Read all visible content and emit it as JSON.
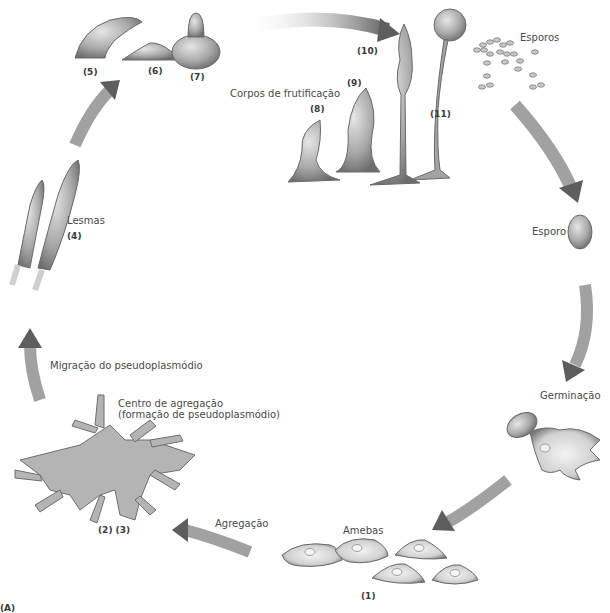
{
  "diagram": {
    "panel_label": "(A)",
    "stages": [
      {
        "id": "amebas",
        "label": "Amebas",
        "number": "(1)"
      },
      {
        "id": "agregacao",
        "label": "Agregação"
      },
      {
        "id": "centro",
        "label_line1": "Centro de agregação",
        "label_line2": "(formação de pseudoplasmódio)",
        "number": "(2) (3)"
      },
      {
        "id": "migracao",
        "label": "Migração do pseudoplasmódio"
      },
      {
        "id": "lesmas",
        "label": "Lesmas",
        "number": "(4)"
      },
      {
        "id": "s5",
        "number": "(5)"
      },
      {
        "id": "s6",
        "number": "(6)"
      },
      {
        "id": "s7",
        "number": "(7)"
      },
      {
        "id": "corpos",
        "label": "Corpos de frutificação"
      },
      {
        "id": "s8",
        "number": "(8)"
      },
      {
        "id": "s9",
        "number": "(9)"
      },
      {
        "id": "s10",
        "number": "(10)"
      },
      {
        "id": "s11",
        "number": "(11)"
      },
      {
        "id": "esporos",
        "label": "Esporos"
      },
      {
        "id": "esporo",
        "label": "Esporo"
      },
      {
        "id": "germinacao",
        "label": "Germinação"
      }
    ],
    "colors": {
      "organism_fill": "#a8a8a8",
      "organism_dark": "#707070",
      "arrow": "#6e6e6e",
      "text": "#4a4a4a"
    }
  }
}
